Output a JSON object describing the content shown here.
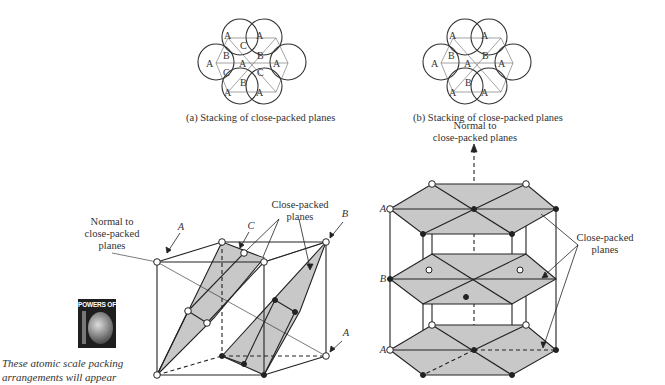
{
  "figure": {
    "panel_a": {
      "caption": "(a) Stacking of close-packed planes",
      "rows": [
        [
          "A",
          "C",
          "A"
        ],
        [
          "B",
          "B"
        ],
        [
          "A",
          "A",
          "A"
        ],
        [
          "C",
          "C"
        ],
        [
          "B"
        ],
        [
          "A",
          "A"
        ]
      ]
    },
    "panel_b": {
      "caption": "(b) Stacking of close-packed planes",
      "rows": [
        [
          "A",
          "A"
        ],
        [
          "B",
          "B"
        ],
        [
          "A",
          "A",
          "A"
        ],
        [
          "B"
        ],
        [
          "A",
          "A"
        ]
      ]
    },
    "fcc_cell": {
      "normal_label": "Normal to close-packed planes",
      "normal_lines": [
        "Normal to",
        "close-packed",
        "planes"
      ],
      "planes_label_lines": [
        "Close-packed",
        "planes"
      ],
      "layer_labels": {
        "a_top": "A",
        "c": "C",
        "b": "B",
        "a_bottom": "A"
      }
    },
    "hcp_cell": {
      "normal_lines": [
        "Normal to",
        "close-packed planes"
      ],
      "planes_label_lines": [
        "Close-packed",
        "planes"
      ],
      "layer_labels": {
        "top": "A",
        "middle": "B",
        "bottom": "A"
      }
    },
    "colors": {
      "plane_fill": "#c8c8c8",
      "line": "#222222"
    }
  },
  "sidebar": {
    "badge_text": "POWERS OF",
    "badge_digit": "10",
    "note_lines": [
      "These atomic scale packing",
      "arrangements will appear"
    ]
  }
}
